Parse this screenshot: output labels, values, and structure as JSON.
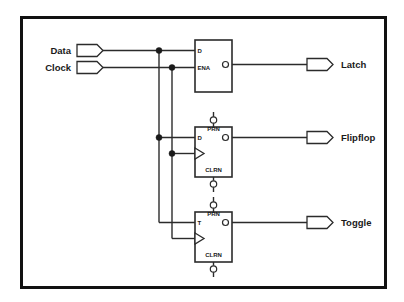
{
  "diagram": {
    "background_color": "#ffffff",
    "border_color": "#111111",
    "wire_color": "#2b2b2b",
    "inputs": [
      {
        "name": "data-input",
        "label": "Data"
      },
      {
        "name": "clock-input",
        "label": "Clock"
      }
    ],
    "outputs": [
      {
        "name": "latch-output",
        "label": "Latch"
      },
      {
        "name": "flipflop-output",
        "label": "Flipflop"
      },
      {
        "name": "toggle-output",
        "label": "Toggle"
      }
    ],
    "blocks": [
      {
        "name": "latch-block",
        "ports": {
          "in_top": "D",
          "in_bottom": "ENA",
          "out": "Q"
        }
      },
      {
        "name": "flipflop-block",
        "ports": {
          "preset": "PRN",
          "data": "D",
          "out": "Q",
          "clear": "CLRN"
        }
      },
      {
        "name": "toggle-block",
        "ports": {
          "preset": "PRN",
          "data": "T",
          "out": "Q",
          "clear": "CLRN"
        }
      }
    ]
  }
}
